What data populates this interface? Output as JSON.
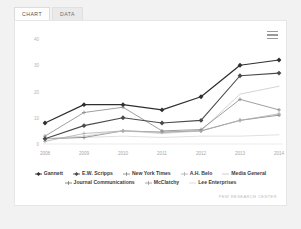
{
  "tabs": [
    {
      "label": "CHART",
      "active": true
    },
    {
      "label": "DATA",
      "active": false
    }
  ],
  "menu": {
    "icon": "hamburger-menu-icon",
    "label": "Chart context menu"
  },
  "attribution": "PEW RESEARCH CENTER",
  "chart_data": {
    "type": "line",
    "title": "",
    "xlabel": "",
    "ylabel": "",
    "x": [
      "2008",
      "2009",
      "2010",
      "2011",
      "2012",
      "2013",
      "2014"
    ],
    "ylim": [
      0,
      40
    ],
    "yticks": [
      0,
      10,
      20,
      30,
      40
    ],
    "ytick_labels": [
      "0",
      "10",
      "20",
      "30",
      "40"
    ],
    "grid": false,
    "legend_position": "bottom",
    "series": [
      {
        "name": "Gannett",
        "color": "#2f2f2f",
        "marker": "diamond",
        "width": 1.25,
        "values": [
          8,
          15,
          15,
          13,
          18,
          30,
          32
        ]
      },
      {
        "name": "E.W. Scripps",
        "color": "#4a4a4a",
        "marker": "diamond",
        "width": 1.1,
        "values": [
          2,
          7,
          10,
          8,
          9,
          26,
          27
        ]
      },
      {
        "name": "New York Times",
        "color": "#8e8e8e",
        "marker": "plus",
        "width": 0.85,
        "values": [
          3,
          12,
          14,
          5,
          5.5,
          17,
          13
        ]
      },
      {
        "name": "A.H. Belo",
        "color": "#b0b0b0",
        "marker": "plus",
        "width": 0.8,
        "values": [
          1,
          4,
          5,
          4.5,
          5,
          9,
          11.5
        ]
      },
      {
        "name": "Media General",
        "color": "#c9c9c9",
        "marker": "none",
        "width": 0.8,
        "values": [
          2,
          3,
          5,
          4,
          5,
          19,
          22
        ]
      },
      {
        "name": "Journal Communications",
        "color": "#7d7d7d",
        "marker": "plus",
        "width": 0.8,
        "values": [
          2,
          2.5,
          5,
          4.5,
          5,
          9,
          11
        ]
      },
      {
        "name": "Lee Enterprises",
        "color": "#d8d8d8",
        "marker": "none",
        "width": 0.8,
        "values": [
          2,
          2.5,
          3,
          2.5,
          3,
          3,
          3.5
        ]
      }
    ]
  },
  "legend_rows": [
    [
      "Gannett",
      "E.W. Scripps",
      "New York Times",
      "A.H. Belo",
      "Media General"
    ],
    [
      "Journal Communications",
      "McClatchy",
      "Lee Enterprises"
    ]
  ],
  "legend_extra": [
    {
      "name": "McClatchy",
      "color": "#9c9c9c",
      "marker": "plus"
    }
  ]
}
